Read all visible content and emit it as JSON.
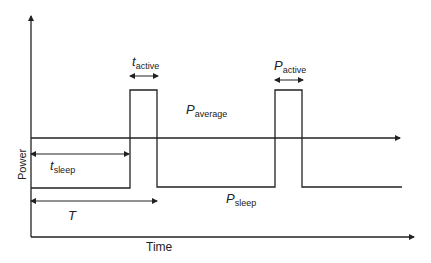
{
  "diagram": {
    "type": "power-vs-time-duty-cycle",
    "axes": {
      "xlabel": "Time",
      "ylabel": "Power"
    },
    "labels": {
      "t_active": {
        "main": "t",
        "sub": "active"
      },
      "P_active": {
        "main": "P",
        "sub": "active"
      },
      "P_average": {
        "main": "P",
        "sub": "average"
      },
      "t_sleep": {
        "main": "t",
        "sub": "sleep"
      },
      "P_sleep": {
        "main": "P",
        "sub": "sleep"
      },
      "T": {
        "main": "T"
      }
    },
    "colors": {
      "line": "#222222",
      "background": "#ffffff"
    }
  }
}
